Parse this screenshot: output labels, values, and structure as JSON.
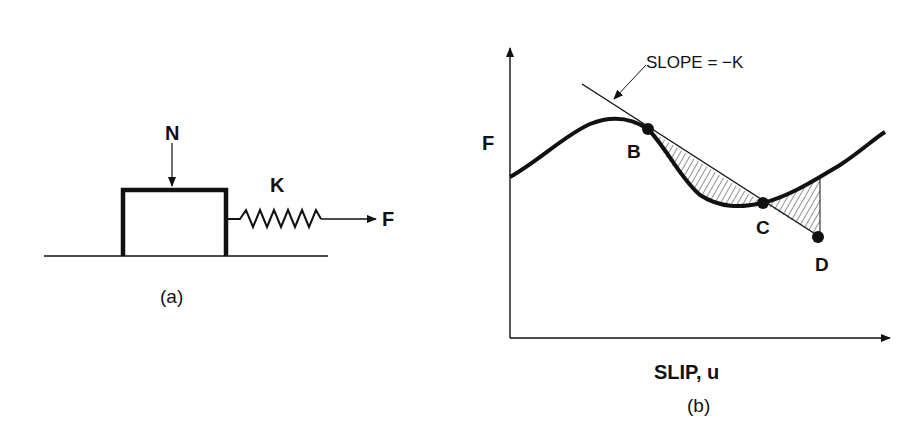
{
  "figure_a": {
    "caption": "(a)",
    "normal_force_label": "N",
    "spring_label": "K",
    "applied_force_label": "F"
  },
  "figure_b": {
    "caption": "(b)",
    "y_axis_label": "F",
    "x_axis_label": "SLIP, u",
    "slope_annotation": "SLOPE = −K",
    "points": [
      "B",
      "C",
      "D"
    ]
  },
  "colors": {
    "ink": "#111111",
    "background": "#ffffff"
  }
}
